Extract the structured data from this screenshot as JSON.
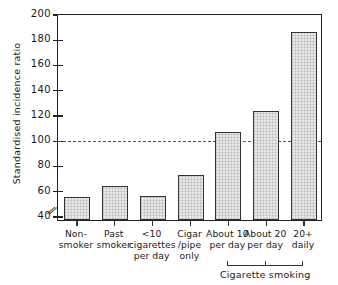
{
  "chart_data": {
    "type": "bar",
    "title": "",
    "xlabel": "",
    "ylabel": "Standardised incidence ratio",
    "ylim": [
      36,
      200
    ],
    "yticks": [
      40,
      60,
      80,
      100,
      120,
      140,
      160,
      180,
      200
    ],
    "grid": false,
    "axis_break": true,
    "axis_break_note": "y-axis broken below 40",
    "reference_line": {
      "value": 100,
      "style": "dash-dot"
    },
    "categories": [
      "Non-\nsmoker",
      "Past\nsmoker",
      "<10\ncigarettes\nper day",
      "Cigar\n/pipe\nonly",
      "About 10\nper day",
      "About 20\nper day",
      "20+\ndaily"
    ],
    "values": [
      54,
      63,
      55,
      72,
      106,
      122,
      185
    ],
    "group_bracket": {
      "label": "Cigarette smoking",
      "covers": [
        "About 10\nper day",
        "About 20\nper day",
        "20+\ndaily"
      ]
    },
    "colors": {
      "bar_fill": "#e8e8e8",
      "bar_edge": "#333333",
      "axis": "#222222",
      "reference_line": "#555555",
      "background": "#ffffff"
    }
  }
}
